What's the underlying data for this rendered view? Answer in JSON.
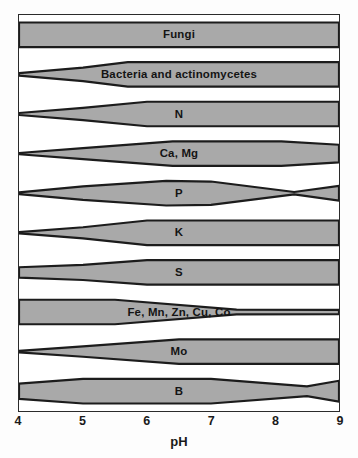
{
  "chart_data": {
    "type": "area",
    "xlabel": "pH",
    "ylabel": "",
    "xlim": [
      4,
      9
    ],
    "grid": false,
    "legend": "none",
    "tick_labels": [
      "4",
      "5",
      "6",
      "7",
      "8",
      "9"
    ],
    "ticks": [
      4,
      5,
      6,
      7,
      8,
      9
    ],
    "fill_color": "#a9a9a9",
    "line_color": "#1c1c1c",
    "background": "#ffffff",
    "note": "Band thickness at each pH encodes relative availability (0-1 of slot height)",
    "series": [
      {
        "name": "Fungi",
        "label": "Fungi",
        "x": [
          4,
          9
        ],
        "width": [
          1.0,
          1.0
        ]
      },
      {
        "name": "Bacteria and actinomycetes",
        "label": "Bacteria and actinomycetes",
        "x": [
          4,
          5,
          5.7,
          9
        ],
        "width": [
          0.1,
          0.55,
          1.0,
          1.0
        ]
      },
      {
        "name": "N",
        "label": "N",
        "x": [
          4,
          5,
          6,
          9
        ],
        "width": [
          0.08,
          0.5,
          1.0,
          1.0
        ]
      },
      {
        "name": "Ca, Mg",
        "label": "Ca, Mg",
        "x": [
          4,
          5,
          6.4,
          8.1,
          9
        ],
        "width": [
          0.05,
          0.45,
          1.0,
          1.0,
          0.72
        ]
      },
      {
        "name": "P",
        "label": "P",
        "x": [
          4,
          5,
          6.3,
          7.0,
          8.3,
          9
        ],
        "width": [
          0.07,
          0.55,
          1.0,
          0.95,
          0.1,
          0.6
        ]
      },
      {
        "name": "K",
        "label": "K",
        "x": [
          4,
          5,
          6.0,
          9
        ],
        "width": [
          0.05,
          0.45,
          1.0,
          1.0
        ]
      },
      {
        "name": "S",
        "label": "S",
        "x": [
          4,
          5,
          6.0,
          9
        ],
        "width": [
          0.42,
          0.62,
          1.0,
          1.0
        ]
      },
      {
        "name": "Fe, Mn, Zn, Cu, Co",
        "label": "Fe, Mn, Zn, Cu, Co",
        "x": [
          4,
          5.5,
          7.4,
          9
        ],
        "width": [
          1.0,
          1.0,
          0.2,
          0.18
        ]
      },
      {
        "name": "Mo",
        "label": "Mo",
        "x": [
          4,
          5,
          6.5,
          9
        ],
        "width": [
          0.06,
          0.42,
          1.0,
          1.0
        ]
      },
      {
        "name": "B",
        "label": "B",
        "x": [
          4,
          5,
          7.0,
          8.5,
          9
        ],
        "width": [
          0.62,
          1.0,
          1.0,
          0.4,
          0.85
        ]
      }
    ]
  }
}
